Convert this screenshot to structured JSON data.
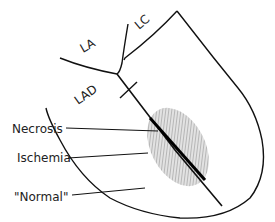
{
  "diagram": {
    "vessel_labels": {
      "la": "LA",
      "lc": "LC",
      "lad": "LAD"
    },
    "zone_labels": {
      "necrosis": "Necrosis",
      "ischemia": "Ischemia",
      "normal": "\"Normal\""
    },
    "colors": {
      "stroke": "#111111",
      "ischemia_fill": "#b5b5b5",
      "background": "#ffffff"
    }
  }
}
